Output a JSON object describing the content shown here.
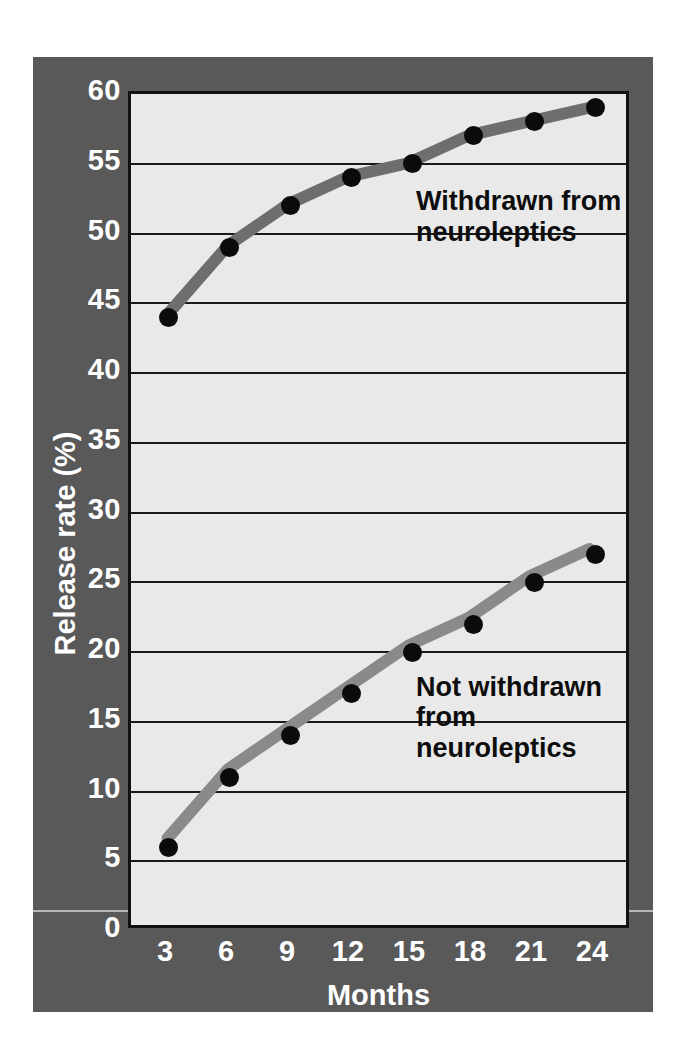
{
  "chart_data": {
    "type": "line",
    "title": "",
    "xlabel": "Months",
    "ylabel": "Release rate (%)",
    "x": [
      3,
      6,
      9,
      12,
      15,
      18,
      21,
      24
    ],
    "xtick_labels": [
      "3",
      "6",
      "9",
      "12",
      "15",
      "18",
      "21",
      "24"
    ],
    "ytick_labels": [
      "0",
      "5",
      "10",
      "15",
      "20",
      "25",
      "30",
      "35",
      "40",
      "45",
      "50",
      "55",
      "60"
    ],
    "yticks": [
      0,
      5,
      10,
      15,
      20,
      25,
      30,
      35,
      40,
      45,
      50,
      55,
      60
    ],
    "xlim": [
      3,
      24
    ],
    "ylim": [
      0,
      60
    ],
    "grid": "horizontal",
    "legend": "inline-annotations",
    "series": [
      {
        "name": "Withdrawn from neuroleptics",
        "values": [
          44,
          49,
          52,
          54,
          55,
          57,
          58,
          59
        ],
        "line_color": "#6e6e6e",
        "marker_color": "#0b0b0b"
      },
      {
        "name": "Not withdrawn from neuroleptics",
        "values": [
          6,
          11,
          14,
          17,
          20,
          22,
          25,
          27
        ],
        "line_color": "#8a8a8a",
        "marker_color": "#0b0b0b"
      }
    ],
    "annotations": [
      {
        "text": "Withdrawn from\nneuroleptics",
        "x_month": 15.2,
        "y_value": 53.4
      },
      {
        "text": "Not withdrawn\nfrom neuroleptics",
        "x_month": 15.2,
        "y_value": 18.6
      }
    ]
  },
  "colors": {
    "figure_background": "#595959",
    "plot_background": "#e9e9e9",
    "axis_frame": "#111111",
    "gridline": "#1a1a1a",
    "tick_label": "#ffffff",
    "annotation_text": "#0d0d0d",
    "page_background": "#ffffff"
  }
}
